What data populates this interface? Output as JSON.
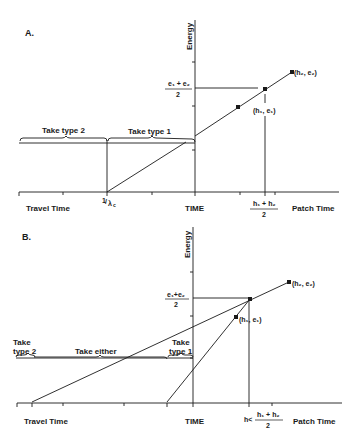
{
  "panels": [
    {
      "id": "A",
      "label": "A.",
      "y_axis_label": "Energy",
      "x_axis_center_label": "TIME",
      "x_left_label": "Travel Time",
      "x_right_label": "Patch Time",
      "travel_intercept_label": "1/λc",
      "travel_intercept_num": "1",
      "travel_intercept_den": "λ",
      "travel_intercept_sub": "c",
      "energy_mid_num": "e₁ + e₂",
      "energy_mid_den": "2",
      "time_mid_num": "h₁ + h₂",
      "time_mid_den": "2",
      "point1_label": "(h₁, e₁)",
      "point2_label": "(h₂, e₂)",
      "braces": [
        "Take type 2",
        "Take type 1"
      ]
    },
    {
      "id": "B",
      "label": "B.",
      "y_axis_label": "Energy",
      "x_axis_center_label": "TIME",
      "x_left_label": "Travel Time",
      "x_right_label": "Patch Time",
      "energy_mid_num": "e₁+e₂",
      "energy_mid_den": "2",
      "time_mid_prefix": "h<",
      "time_mid_num": "h₁ + h₂",
      "time_mid_den": "2",
      "point1_label": "(h₁, e₁)",
      "point2_label": "(h₂, e₂)",
      "braces": [
        {
          "line1": "Take",
          "line2": "type 2"
        },
        {
          "line1": "Take either",
          "line2": ""
        },
        {
          "line1": "Take",
          "line2": "type 1"
        }
      ]
    }
  ],
  "colors": {
    "ink": "#1a1a1a",
    "background": "#ffffff"
  }
}
